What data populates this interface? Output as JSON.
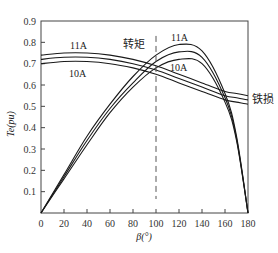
{
  "chart_data": {
    "type": "line",
    "title": "",
    "xlabel": "β(°)",
    "ylabel": "Te(pu)",
    "xlim": [
      0,
      180
    ],
    "ylim": [
      0,
      0.9
    ],
    "x_ticks": [
      0,
      20,
      40,
      60,
      80,
      100,
      120,
      140,
      160,
      180
    ],
    "y_ticks": [
      0.1,
      0.2,
      0.3,
      0.4,
      0.5,
      0.6,
      0.7,
      0.8,
      0.9
    ],
    "grid": false,
    "reference_line": {
      "x": 100,
      "style": "dashed"
    },
    "annotations": {
      "torque_label": "转矩",
      "iron_loss_label": "铁损",
      "torque_top_label": "11A",
      "torque_bottom_label": "10A",
      "iron_top_label": "11A",
      "iron_bottom_label": "10A"
    },
    "x": [
      0,
      20,
      40,
      60,
      80,
      100,
      120,
      140,
      160,
      170,
      180
    ],
    "series": [
      {
        "name": "转矩 11A",
        "group": "torque",
        "values": [
          0,
          0.18,
          0.36,
          0.51,
          0.64,
          0.74,
          0.79,
          0.76,
          0.56,
          0.36,
          0
        ]
      },
      {
        "name": "转矩 10.5A",
        "group": "torque",
        "values": [
          0,
          0.17,
          0.34,
          0.49,
          0.61,
          0.71,
          0.755,
          0.73,
          0.54,
          0.35,
          0
        ]
      },
      {
        "name": "转矩 10A",
        "group": "torque",
        "values": [
          0,
          0.16,
          0.32,
          0.47,
          0.59,
          0.68,
          0.72,
          0.7,
          0.52,
          0.34,
          0
        ]
      },
      {
        "name": "铁损 11A",
        "group": "iron_loss",
        "values": [
          0.74,
          0.75,
          0.75,
          0.74,
          0.72,
          0.69,
          0.65,
          0.61,
          0.57,
          0.56,
          0.55
        ]
      },
      {
        "name": "铁损 10.5A",
        "group": "iron_loss",
        "values": [
          0.72,
          0.73,
          0.73,
          0.72,
          0.7,
          0.67,
          0.63,
          0.59,
          0.55,
          0.54,
          0.53
        ]
      },
      {
        "name": "铁损 10A",
        "group": "iron_loss",
        "values": [
          0.7,
          0.71,
          0.71,
          0.7,
          0.68,
          0.65,
          0.61,
          0.57,
          0.53,
          0.52,
          0.51
        ]
      }
    ]
  }
}
